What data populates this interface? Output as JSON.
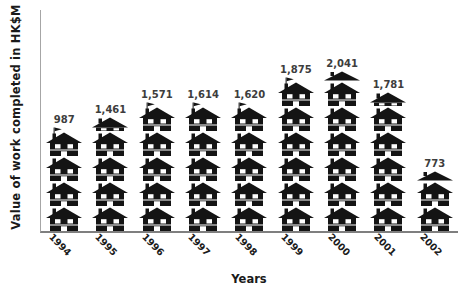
{
  "figure": {
    "y_axis_title": "Value of work completed in HK$M",
    "x_axis_title": "Years"
  },
  "chart_data": {
    "type": "bar",
    "subtype": "pictogram",
    "icon": "house",
    "icon_unit_value": 329,
    "title": "",
    "xlabel": "Years",
    "ylabel": "Value of work completed in HK$M",
    "grid": false,
    "legend": false,
    "y_axis_tick_labels": [],
    "categories": [
      "1994",
      "1995",
      "1996",
      "1997",
      "1998",
      "1999",
      "2000",
      "2001",
      "2002"
    ],
    "values": [
      987,
      1461,
      1571,
      1614,
      1620,
      1875,
      2041,
      1781,
      773
    ],
    "columns": [
      {
        "year": "1994",
        "value": 987,
        "label": "987",
        "full_houses": 3,
        "top_icon": "flag"
      },
      {
        "year": "1995",
        "value": 1461,
        "label": "1,461",
        "full_houses": 4,
        "top_icon": "mid"
      },
      {
        "year": "1996",
        "value": 1571,
        "label": "1,571",
        "full_houses": 4,
        "top_icon": "flag"
      },
      {
        "year": "1997",
        "value": 1614,
        "label": "1,614",
        "full_houses": 4,
        "top_icon": "flag"
      },
      {
        "year": "1998",
        "value": 1620,
        "label": "1,620",
        "full_houses": 4,
        "top_icon": "flag"
      },
      {
        "year": "1999",
        "value": 1875,
        "label": "1,875",
        "full_houses": 5,
        "top_icon": "flag"
      },
      {
        "year": "2000",
        "value": 2041,
        "label": "2,041",
        "full_houses": 6,
        "top_icon": "roof"
      },
      {
        "year": "2001",
        "value": 1781,
        "label": "1,781",
        "full_houses": 5,
        "top_icon": "mid"
      },
      {
        "year": "2002",
        "value": 773,
        "label": "773",
        "full_houses": 2,
        "top_icon": "roof"
      }
    ],
    "colors": {
      "icon": "#141414",
      "value_label": "#3d3d3d",
      "axis_vertical": "#a6a6a6",
      "axis_horizontal": "#7f7f7f",
      "text": "#1a1a1a",
      "background": "#ffffff"
    }
  }
}
